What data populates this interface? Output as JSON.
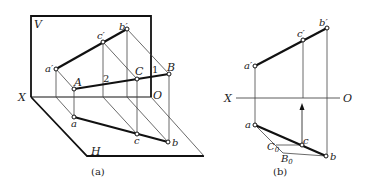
{
  "figure": {
    "panel_a": {
      "caption": "(a)",
      "plane_labels": {
        "V": "V",
        "H": "H",
        "X": "X",
        "O": "O"
      },
      "space_points": {
        "A": "A",
        "B": "B",
        "C": "C"
      },
      "v_projections": {
        "a": "a′",
        "b": "b′",
        "c": "c′"
      },
      "h_projections": {
        "a": "a",
        "b": "b",
        "c": "c"
      },
      "segment_ratio_labels": {
        "AC": "2",
        "CB": "1"
      }
    },
    "panel_b": {
      "caption": "(b)",
      "axis_labels": {
        "X": "X",
        "O": "O"
      },
      "v_projections": {
        "a": "a′",
        "b": "b′",
        "c": "c′"
      },
      "h_projections": {
        "a": "a",
        "b": "b",
        "c": "c"
      },
      "auxiliary_points": {
        "C0": "C",
        "C0_sub": "0",
        "B0": "B",
        "B0_sub": "0"
      }
    }
  }
}
